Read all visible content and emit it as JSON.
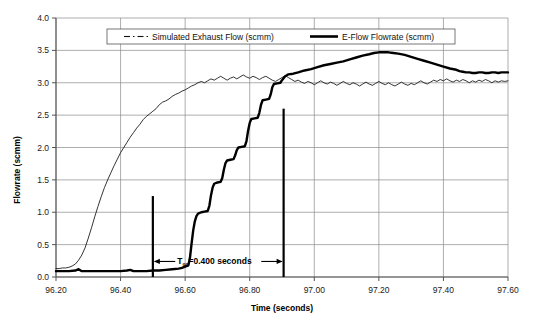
{
  "chart_data": {
    "type": "line",
    "title": "",
    "xlabel": "Time (seconds)",
    "ylabel": "Flowrate (scmm)",
    "xlim": [
      96.2,
      97.6
    ],
    "ylim": [
      0.0,
      4.0
    ],
    "xticks": [
      "96.20",
      "96.40",
      "96.60",
      "96.80",
      "97.00",
      "97.20",
      "97.40",
      "97.60"
    ],
    "yticks": [
      "0.0",
      "0.5",
      "1.0",
      "1.5",
      "2.0",
      "2.5",
      "3.0",
      "3.5",
      "4.0"
    ],
    "grid": true,
    "legend_position": "top-center",
    "series": [
      {
        "name": "Simulated Exhaust Flow (scmm)",
        "style": "thin-dashdot",
        "points": [
          [
            96.2,
            0.13
          ],
          [
            96.21,
            0.13
          ],
          [
            96.22,
            0.14
          ],
          [
            96.23,
            0.14
          ],
          [
            96.24,
            0.15
          ],
          [
            96.25,
            0.17
          ],
          [
            96.26,
            0.2
          ],
          [
            96.27,
            0.26
          ],
          [
            96.28,
            0.34
          ],
          [
            96.29,
            0.45
          ],
          [
            96.3,
            0.6
          ],
          [
            96.31,
            0.76
          ],
          [
            96.32,
            0.93
          ],
          [
            96.33,
            1.09
          ],
          [
            96.34,
            1.24
          ],
          [
            96.35,
            1.38
          ],
          [
            96.36,
            1.5
          ],
          [
            96.37,
            1.61
          ],
          [
            96.38,
            1.72
          ],
          [
            96.39,
            1.82
          ],
          [
            96.4,
            1.92
          ],
          [
            96.41,
            2.0
          ],
          [
            96.42,
            2.08
          ],
          [
            96.43,
            2.16
          ],
          [
            96.44,
            2.23
          ],
          [
            96.45,
            2.3
          ],
          [
            96.46,
            2.36
          ],
          [
            96.47,
            2.43
          ],
          [
            96.48,
            2.48
          ],
          [
            96.49,
            2.52
          ],
          [
            96.5,
            2.56
          ],
          [
            96.51,
            2.6
          ],
          [
            96.52,
            2.66
          ],
          [
            96.53,
            2.7
          ],
          [
            96.54,
            2.72
          ],
          [
            96.55,
            2.75
          ],
          [
            96.56,
            2.79
          ],
          [
            96.57,
            2.82
          ],
          [
            96.58,
            2.84
          ],
          [
            96.59,
            2.87
          ],
          [
            96.6,
            2.89
          ],
          [
            96.61,
            2.92
          ],
          [
            96.62,
            2.95
          ],
          [
            96.63,
            2.97
          ],
          [
            96.64,
            3.0
          ],
          [
            96.65,
            3.02
          ],
          [
            96.66,
            3.0
          ],
          [
            96.67,
            3.03
          ],
          [
            96.68,
            3.06
          ],
          [
            96.69,
            3.04
          ],
          [
            96.7,
            3.07
          ],
          [
            96.71,
            3.1
          ],
          [
            96.72,
            3.07
          ],
          [
            96.73,
            3.04
          ],
          [
            96.74,
            3.07
          ],
          [
            96.75,
            3.09
          ],
          [
            96.76,
            3.06
          ],
          [
            96.77,
            3.09
          ],
          [
            96.78,
            3.12
          ],
          [
            96.79,
            3.09
          ],
          [
            96.8,
            3.07
          ],
          [
            96.81,
            3.1
          ],
          [
            96.82,
            3.08
          ],
          [
            96.83,
            3.05
          ],
          [
            96.84,
            3.08
          ],
          [
            96.85,
            3.1
          ],
          [
            96.86,
            3.07
          ],
          [
            96.87,
            3.04
          ],
          [
            96.88,
            3.02
          ],
          [
            96.89,
            3.05
          ],
          [
            96.9,
            3.08
          ],
          [
            96.91,
            3.11
          ],
          [
            96.92,
            3.08
          ],
          [
            96.93,
            3.05
          ],
          [
            96.94,
            3.02
          ],
          [
            96.95,
            3.04
          ],
          [
            96.96,
            3.01
          ],
          [
            96.97,
            2.99
          ],
          [
            96.98,
            3.02
          ],
          [
            96.99,
            3.0
          ],
          [
            97.0,
            2.97
          ],
          [
            97.01,
            3.0
          ],
          [
            97.02,
            3.03
          ],
          [
            97.03,
            3.0
          ],
          [
            97.04,
            2.98
          ],
          [
            97.05,
            3.01
          ],
          [
            97.06,
            2.99
          ],
          [
            97.07,
            2.96
          ],
          [
            97.08,
            2.99
          ],
          [
            97.09,
            3.02
          ],
          [
            97.1,
            2.99
          ],
          [
            97.11,
            2.97
          ],
          [
            97.12,
            3.0
          ],
          [
            97.13,
            2.98
          ],
          [
            97.14,
            2.95
          ],
          [
            97.15,
            2.98
          ],
          [
            97.16,
            3.01
          ],
          [
            97.17,
            2.98
          ],
          [
            97.18,
            2.96
          ],
          [
            97.19,
            2.99
          ],
          [
            97.2,
            3.02
          ],
          [
            97.21,
            2.99
          ],
          [
            97.22,
            2.97
          ],
          [
            97.23,
            3.0
          ],
          [
            97.24,
            2.97
          ],
          [
            97.25,
            2.95
          ],
          [
            97.26,
            2.98
          ],
          [
            97.27,
            3.01
          ],
          [
            97.28,
            2.98
          ],
          [
            97.29,
            2.96
          ],
          [
            97.3,
            2.99
          ],
          [
            97.31,
            2.97
          ],
          [
            97.32,
            3.0
          ],
          [
            97.33,
            3.03
          ],
          [
            97.34,
            3.0
          ],
          [
            97.35,
            2.98
          ],
          [
            97.36,
            3.01
          ],
          [
            97.37,
            3.04
          ],
          [
            97.38,
            3.02
          ],
          [
            97.39,
            3.05
          ],
          [
            97.4,
            3.03
          ],
          [
            97.41,
            3.06
          ],
          [
            97.42,
            3.03
          ],
          [
            97.43,
            3.01
          ],
          [
            97.44,
            3.04
          ],
          [
            97.45,
            3.02
          ],
          [
            97.46,
            3.05
          ],
          [
            97.47,
            3.03
          ],
          [
            97.48,
            3.0
          ],
          [
            97.49,
            3.03
          ],
          [
            97.5,
            3.01
          ],
          [
            97.51,
            3.04
          ],
          [
            97.52,
            3.02
          ],
          [
            97.53,
            3.05
          ],
          [
            97.54,
            3.03
          ],
          [
            97.55,
            3.0
          ],
          [
            97.56,
            3.03
          ],
          [
            97.57,
            3.01
          ],
          [
            97.58,
            3.03
          ],
          [
            97.59,
            3.02
          ],
          [
            97.6,
            3.03
          ]
        ]
      },
      {
        "name": "E-Flow Flowrate (scmm)",
        "style": "thick-solid",
        "points": [
          [
            96.2,
            0.09
          ],
          [
            96.22,
            0.09
          ],
          [
            96.24,
            0.09
          ],
          [
            96.26,
            0.1
          ],
          [
            96.27,
            0.12
          ],
          [
            96.28,
            0.09
          ],
          [
            96.3,
            0.09
          ],
          [
            96.32,
            0.09
          ],
          [
            96.34,
            0.09
          ],
          [
            96.36,
            0.09
          ],
          [
            96.38,
            0.09
          ],
          [
            96.4,
            0.09
          ],
          [
            96.42,
            0.1
          ],
          [
            96.43,
            0.11
          ],
          [
            96.44,
            0.09
          ],
          [
            96.46,
            0.09
          ],
          [
            96.48,
            0.09
          ],
          [
            96.5,
            0.1
          ],
          [
            96.52,
            0.1
          ],
          [
            96.54,
            0.11
          ],
          [
            96.56,
            0.12
          ],
          [
            96.58,
            0.13
          ],
          [
            96.59,
            0.14
          ],
          [
            96.6,
            0.16
          ],
          [
            96.61,
            0.18
          ],
          [
            96.615,
            0.3
          ],
          [
            96.62,
            0.52
          ],
          [
            96.625,
            0.72
          ],
          [
            96.63,
            0.86
          ],
          [
            96.635,
            0.94
          ],
          [
            96.64,
            0.98
          ],
          [
            96.65,
            1.0
          ],
          [
            96.66,
            1.01
          ],
          [
            96.67,
            1.02
          ],
          [
            96.675,
            1.1
          ],
          [
            96.68,
            1.26
          ],
          [
            96.685,
            1.38
          ],
          [
            96.69,
            1.44
          ],
          [
            96.7,
            1.46
          ],
          [
            96.71,
            1.47
          ],
          [
            96.715,
            1.53
          ],
          [
            96.72,
            1.66
          ],
          [
            96.725,
            1.76
          ],
          [
            96.73,
            1.8
          ],
          [
            96.74,
            1.81
          ],
          [
            96.75,
            1.82
          ],
          [
            96.755,
            1.88
          ],
          [
            96.76,
            1.96
          ],
          [
            96.765,
            2.0
          ],
          [
            96.775,
            2.01
          ],
          [
            96.785,
            2.02
          ],
          [
            96.79,
            2.1
          ],
          [
            96.795,
            2.26
          ],
          [
            96.8,
            2.38
          ],
          [
            96.805,
            2.44
          ],
          [
            96.815,
            2.45
          ],
          [
            96.825,
            2.46
          ],
          [
            96.83,
            2.54
          ],
          [
            96.835,
            2.66
          ],
          [
            96.84,
            2.73
          ],
          [
            96.85,
            2.74
          ],
          [
            96.86,
            2.75
          ],
          [
            96.865,
            2.82
          ],
          [
            96.87,
            2.93
          ],
          [
            96.875,
            2.98
          ],
          [
            96.885,
            2.99
          ],
          [
            96.895,
            3.0
          ],
          [
            96.9,
            3.04
          ],
          [
            96.91,
            3.1
          ],
          [
            96.92,
            3.13
          ],
          [
            96.935,
            3.14
          ],
          [
            96.95,
            3.16
          ],
          [
            96.97,
            3.19
          ],
          [
            96.99,
            3.21
          ],
          [
            97.01,
            3.24
          ],
          [
            97.03,
            3.27
          ],
          [
            97.05,
            3.29
          ],
          [
            97.07,
            3.31
          ],
          [
            97.09,
            3.33
          ],
          [
            97.11,
            3.36
          ],
          [
            97.13,
            3.39
          ],
          [
            97.15,
            3.42
          ],
          [
            97.17,
            3.44
          ],
          [
            97.185,
            3.46
          ],
          [
            97.2,
            3.47
          ],
          [
            97.215,
            3.47
          ],
          [
            97.23,
            3.47
          ],
          [
            97.245,
            3.46
          ],
          [
            97.26,
            3.45
          ],
          [
            97.28,
            3.43
          ],
          [
            97.3,
            3.4
          ],
          [
            97.32,
            3.37
          ],
          [
            97.34,
            3.34
          ],
          [
            97.36,
            3.31
          ],
          [
            97.38,
            3.28
          ],
          [
            97.4,
            3.25
          ],
          [
            97.42,
            3.22
          ],
          [
            97.44,
            3.2
          ],
          [
            97.45,
            3.18
          ],
          [
            97.46,
            3.17
          ],
          [
            97.47,
            3.16
          ],
          [
            97.48,
            3.16
          ],
          [
            97.49,
            3.15
          ],
          [
            97.5,
            3.15
          ],
          [
            97.51,
            3.16
          ],
          [
            97.52,
            3.16
          ],
          [
            97.53,
            3.15
          ],
          [
            97.54,
            3.15
          ],
          [
            97.55,
            3.16
          ],
          [
            97.56,
            3.16
          ],
          [
            97.57,
            3.15
          ],
          [
            97.58,
            3.16
          ],
          [
            97.59,
            3.16
          ],
          [
            97.6,
            3.16
          ]
        ]
      }
    ],
    "annotations": [
      {
        "name": "t90-measurement",
        "text_prefix": "T",
        "text_subscript": "90",
        "text_suffix": "=0.400 seconds",
        "full_text": "T90=0.400 seconds",
        "marker_left_x": 96.5,
        "marker_left_y_top": 1.25,
        "marker_right_x": 96.905,
        "marker_right_y_top": 2.6,
        "arrow_y": 0.24
      }
    ]
  },
  "legend": {
    "entries": [
      {
        "label": "Simulated Exhaust Flow (scmm)",
        "style": "dashdot"
      },
      {
        "label": "E-Flow Flowrate (scmm)",
        "style": "solid-thick"
      }
    ]
  },
  "colors": {
    "background": "#ffffff",
    "grid": "#8a8a8a",
    "axis": "#555555",
    "series_thin": "#111111",
    "series_thick": "#000000",
    "text": "#1a1a1a"
  }
}
